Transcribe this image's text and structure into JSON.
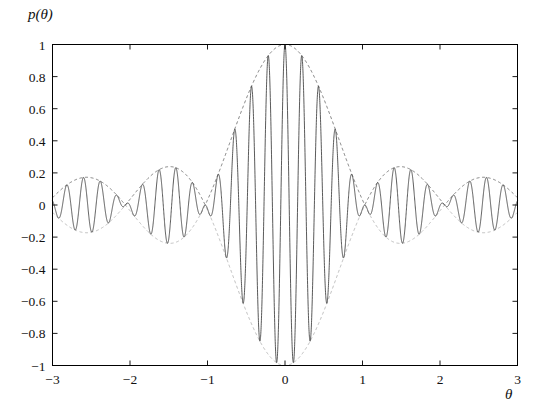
{
  "chart_data": {
    "type": "line",
    "title": "",
    "xlabel": "θ",
    "ylabel": "p(θ)",
    "xlim": [
      -3,
      3
    ],
    "ylim": [
      -1,
      1
    ],
    "grid": false,
    "legend": "none",
    "xticks": [
      -3,
      -2,
      -1,
      0,
      1,
      2,
      3
    ],
    "xticklabels": [
      "−3",
      "−2",
      "−1",
      "0",
      "1",
      "2",
      "3"
    ],
    "yticks": [
      -1,
      -0.8,
      -0.6,
      -0.4,
      -0.2,
      0,
      0.2,
      0.4,
      0.6,
      0.8,
      1
    ],
    "yticklabels": [
      "−1",
      "−0.8",
      "−0.6",
      "−0.4",
      "−0.2",
      "0",
      "0.2",
      "0.4",
      "0.6",
      "0.8",
      "1"
    ],
    "series": [
      {
        "name": "modulated-carrier",
        "role": "main-curve",
        "color": "#3c3c3c",
        "style": "solid",
        "description": "Rapidly oscillating carrier cos(omega*theta) modulated by a sinc-like interference envelope",
        "carrier_frequency": 29.0,
        "envelope_form": "N-slit interference kernel sin(N*theta/2)/(N*sin(theta/2)) with N=6",
        "envelope_N": 6
      },
      {
        "name": "upper-envelope",
        "role": "envelope",
        "color": "#6e6e6e",
        "style": "dashed",
        "description": "Upper envelope of the oscillation"
      },
      {
        "name": "lower-envelope",
        "role": "envelope",
        "color": "#b0b0b0",
        "style": "dashed",
        "description": "Lower envelope, mirror of the upper envelope"
      }
    ],
    "envelope_nodes": [
      -3.0,
      -2.11,
      -1.03,
      1.03,
      2.11,
      3.0
    ],
    "envelope_peaks": [
      {
        "x": 0.0,
        "y": 1.0
      },
      {
        "x": -1.5,
        "y": 0.21
      },
      {
        "x": 1.5,
        "y": 0.21
      },
      {
        "x": -2.5,
        "y": 0.13
      },
      {
        "x": 2.5,
        "y": 0.13
      }
    ],
    "annotations": []
  },
  "figure": {
    "frame_color": "#000000",
    "background": "#ffffff"
  }
}
